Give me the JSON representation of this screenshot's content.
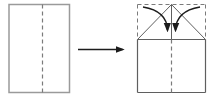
{
  "diagram": {
    "type": "origami-instruction",
    "viewbox": "0 0 214 102",
    "background": "#ffffff",
    "colors": {
      "outline": "#9a9a9a",
      "crease": "#7b7b7b",
      "fold": "#5f5f5f",
      "arrow": "#1c1c1c"
    },
    "dash_pattern": "4 3",
    "panels": [
      {
        "name": "step-1-panel",
        "description": "unfolded-sheet-with-center-crease",
        "shapes": [
          {
            "name": "sheet-outline",
            "type": "rect",
            "x": 9,
            "y": 4.5,
            "w": 60.5,
            "h": 88,
            "color": "outline",
            "width": 1.5
          },
          {
            "name": "sheet-center-crease",
            "type": "line",
            "x1": 42.5,
            "y1": 4.5,
            "x2": 42.5,
            "y2": 92.5,
            "style": "dashed",
            "color": "crease",
            "width": 1.2
          }
        ]
      },
      {
        "name": "transition",
        "description": "next-step-arrow",
        "shapes": [
          {
            "name": "transition-arrow",
            "type": "path",
            "d": "M78,49.5 L122.5,49.5",
            "color": "arrow",
            "width": 1.3,
            "arrowhead": true
          }
        ]
      },
      {
        "name": "step-2-panel",
        "description": "fold-top-corners-down-to-center-line",
        "shapes": [
          {
            "name": "sheet-top-edge-dashed",
            "type": "line",
            "x1": 137.5,
            "y1": 4.5,
            "x2": 205.5,
            "y2": 4.5,
            "style": "dashed",
            "color": "crease",
            "width": 1
          },
          {
            "name": "sheet-upper-left-edge-dashed",
            "type": "line",
            "x1": 137.5,
            "y1": 4.5,
            "x2": 137.5,
            "y2": 39.5,
            "style": "dashed",
            "color": "crease",
            "width": 1
          },
          {
            "name": "sheet-upper-right-edge-dashed",
            "type": "line",
            "x1": 205.5,
            "y1": 4.5,
            "x2": 205.5,
            "y2": 39.5,
            "style": "dashed",
            "color": "crease",
            "width": 1
          },
          {
            "name": "sheet-lower-left-edge",
            "type": "line",
            "x1": 137.5,
            "y1": 39.5,
            "x2": 137.5,
            "y2": 92.5,
            "color": "fold",
            "width": 1.2
          },
          {
            "name": "sheet-lower-right-edge",
            "type": "line",
            "x1": 205.5,
            "y1": 39.5,
            "x2": 205.5,
            "y2": 92.5,
            "color": "fold",
            "width": 1.2
          },
          {
            "name": "sheet-bottom-edge",
            "type": "line",
            "x1": 137.5,
            "y1": 92.5,
            "x2": 205.5,
            "y2": 92.5,
            "color": "fold",
            "width": 1.2
          },
          {
            "name": "fold-baseline",
            "type": "line",
            "x1": 137.5,
            "y1": 39.5,
            "x2": 205.5,
            "y2": 39.5,
            "color": "fold",
            "width": 1.1
          },
          {
            "name": "center-line-upper",
            "type": "line",
            "x1": 171.5,
            "y1": 4.5,
            "x2": 171.5,
            "y2": 39.5,
            "color": "fold",
            "width": 1
          },
          {
            "name": "center-crease-lower-dashed",
            "type": "line",
            "x1": 171.5,
            "y1": 39.5,
            "x2": 171.5,
            "y2": 92.5,
            "style": "dashed",
            "color": "crease",
            "width": 1.2
          },
          {
            "name": "left-fold-diagonal",
            "type": "line",
            "x1": 137.5,
            "y1": 39.5,
            "x2": 171.5,
            "y2": 4.5,
            "color": "fold",
            "width": 1
          },
          {
            "name": "right-fold-diagonal",
            "type": "line",
            "x1": 171.5,
            "y1": 4.5,
            "x2": 205.5,
            "y2": 39.5,
            "color": "fold",
            "width": 1
          },
          {
            "name": "left-fold-motion-arrow",
            "type": "path",
            "d": "M143,7 Q167,11 167.5,30",
            "color": "arrow",
            "width": 1.4,
            "arrowhead": true
          },
          {
            "name": "right-fold-motion-arrow",
            "type": "path",
            "d": "M200,7 Q176,11 175.5,30",
            "color": "arrow",
            "width": 1.4,
            "arrowhead": true
          }
        ]
      }
    ]
  }
}
